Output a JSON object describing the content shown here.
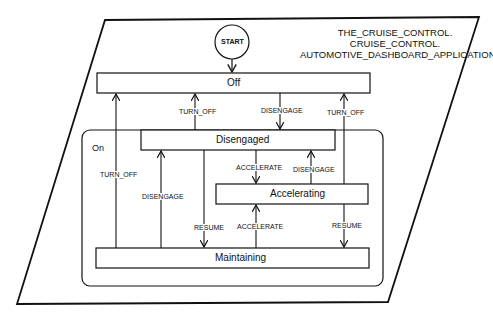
{
  "diagram": {
    "type": "state-transition-diagram",
    "title_lines": [
      "THE_CRUISE_CONTROL.",
      "CRUISE_CONTROL.",
      "AUTOMOTIVE_DASHBOARD_APPLICATION"
    ],
    "start": {
      "label": "START"
    },
    "superstate": {
      "label": "On"
    },
    "states": {
      "off": "Off",
      "disengaged": "Disengaged",
      "accelerating": "Accelerating",
      "maintaining": "Maintaining"
    },
    "transitions": [
      {
        "from": "START",
        "to": "Off",
        "label": ""
      },
      {
        "from": "Disengaged",
        "to": "Off",
        "label": "TURN_OFF"
      },
      {
        "from": "Off",
        "to": "Disengaged",
        "label": "DISENGAGE"
      },
      {
        "from": "Accelerating",
        "to": "Off",
        "label": "TURN_OFF"
      },
      {
        "from": "Maintaining",
        "to": "Off",
        "label": "TURN_OFF"
      },
      {
        "from": "Maintaining",
        "to": "Disengaged",
        "label": "DISENGAGE"
      },
      {
        "from": "Disengaged",
        "to": "Maintaining",
        "label": "RESUME"
      },
      {
        "from": "Disengaged",
        "to": "Accelerating",
        "label": "ACCELERATE"
      },
      {
        "from": "Accelerating",
        "to": "Disengaged",
        "label": "DISENGAGE"
      },
      {
        "from": "Maintaining",
        "to": "Accelerating",
        "label": "ACCELERATE"
      },
      {
        "from": "Accelerating",
        "to": "Maintaining",
        "label": "RESUME"
      }
    ],
    "edge_labels": {
      "turn_off_disengaged_off": "TURN_OFF",
      "disengage_off_disengaged": "DISENGAGE",
      "turn_off_accelerating_off": "TURN_OFF",
      "turn_off_maintaining_off": "TURN_OFF",
      "disengage_maintaining_disengaged": "DISENGAGE",
      "resume_disengaged_maintaining": "RESUME",
      "accelerate_disengaged_accelerating": "ACCELERATE",
      "disengage_accelerating_disengaged": "DISENGAGE",
      "accelerate_maintaining_accelerating": "ACCELERATE",
      "resume_accelerating_maintaining": "RESUME"
    }
  }
}
